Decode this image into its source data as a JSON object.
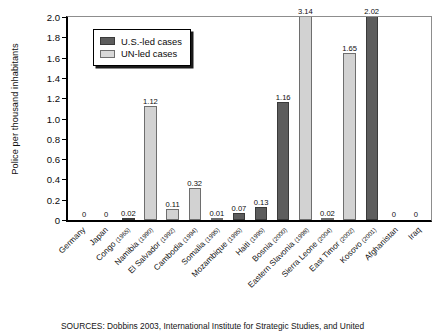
{
  "chart_data": {
    "type": "bar",
    "title": "",
    "xlabel": "",
    "ylabel": "Police per thousand inhabitants",
    "ylim": [
      0,
      2.0
    ],
    "ytick_step": 0.2,
    "yticks": [
      "2.0",
      "1.8",
      "1.6",
      "1.4",
      "1.2",
      "1.0",
      "0.8",
      "0.6",
      "0.4",
      "0.2",
      "0"
    ],
    "grid": false,
    "legend_position": "upper-left-inside",
    "note": "Values 3.14 and 2.02 exceed the 2.0 axis maximum and their bars are clipped at the top frame.",
    "legend": [
      {
        "name": "U.S.-led cases",
        "color": "#5d5d5d"
      },
      {
        "name": "UN-led cases",
        "color": "#d2d2d2"
      }
    ],
    "categories": [
      "Germany",
      "Japan",
      "Congo",
      "Namibia",
      "El Salvador",
      "Cambodia",
      "Somalia",
      "Mozambique",
      "Haiti",
      "Bosnia",
      "Eastern Slavonia",
      "Sierra Leone",
      "East Timor",
      "Kosovo",
      "Afghanistan",
      "Iraq"
    ],
    "years": [
      "",
      "",
      "(1965)",
      "(1990)",
      "(1992)",
      "(1994)",
      "(1995)",
      "(1995)",
      "(1995)",
      "(2000)",
      "(1998)",
      "(2004)",
      "(2002)",
      "(2001)",
      "",
      ""
    ],
    "values": [
      0,
      0,
      0.02,
      1.12,
      0.11,
      0.32,
      0.01,
      0.07,
      0.13,
      1.16,
      3.14,
      0.02,
      1.65,
      2.02,
      0,
      0
    ],
    "value_labels": [
      "0",
      "0",
      "0.02",
      "1.12",
      "0.11",
      "0.32",
      "0.01",
      "0.07",
      "0.13",
      "1.16",
      "3.14",
      "0.02",
      "1.65",
      "2.02",
      "0",
      "0"
    ],
    "series_of_bar": [
      "us",
      "us",
      "us",
      "un",
      "un",
      "un",
      "un",
      "us",
      "us",
      "us",
      "un",
      "un",
      "un",
      "us",
      "us",
      "us"
    ]
  },
  "source": {
    "text": "SOURCES: Dobbins 2003, International Institute for Strategic Studies, and United"
  }
}
